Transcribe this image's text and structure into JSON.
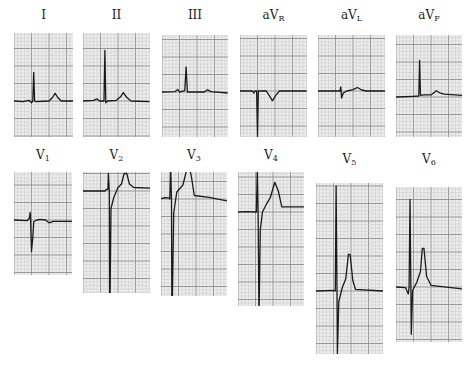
{
  "figure": {
    "paper_speed_mm_per_s": 25,
    "gain_mm_per_mV": 10,
    "grid_color_minor": "#c9c9c9",
    "grid_color_major": "#8f8f8f",
    "paper_color": "#ececec",
    "trace_color": "#1a1a1a"
  },
  "leads": [
    {
      "id": "I",
      "label": "I",
      "sub": "",
      "points": [
        [
          0,
          0
        ],
        [
          0.1,
          -0.02
        ],
        [
          0.17,
          0.02
        ],
        [
          0.2,
          -0.05
        ],
        [
          0.215,
          0
        ],
        [
          0.225,
          0.82
        ],
        [
          0.235,
          0
        ],
        [
          0.25,
          -0.02
        ],
        [
          0.4,
          0
        ],
        [
          0.44,
          0.1
        ],
        [
          0.47,
          0.22
        ],
        [
          0.5,
          0.1
        ],
        [
          0.54,
          0
        ],
        [
          0.68,
          0
        ]
      ]
    },
    {
      "id": "II",
      "label": "II",
      "sub": "",
      "points": [
        [
          0,
          0
        ],
        [
          0.12,
          0.02
        ],
        [
          0.16,
          0.06
        ],
        [
          0.19,
          0
        ],
        [
          0.24,
          0
        ],
        [
          0.25,
          1.45
        ],
        [
          0.26,
          -0.05
        ],
        [
          0.28,
          0
        ],
        [
          0.38,
          0.02
        ],
        [
          0.43,
          0.12
        ],
        [
          0.46,
          0.24
        ],
        [
          0.5,
          0.1
        ],
        [
          0.55,
          0
        ],
        [
          0.76,
          -0.02
        ]
      ]
    },
    {
      "id": "III",
      "label": "III",
      "sub": "",
      "points": [
        [
          0,
          0
        ],
        [
          0.15,
          0.01
        ],
        [
          0.18,
          0.07
        ],
        [
          0.2,
          0
        ],
        [
          0.26,
          0.04
        ],
        [
          0.275,
          0.72
        ],
        [
          0.29,
          0
        ],
        [
          0.48,
          0
        ],
        [
          0.52,
          0.06
        ],
        [
          0.56,
          0.01
        ],
        [
          0.75,
          -0.03
        ]
      ]
    },
    {
      "id": "aVR",
      "label": "aV",
      "sub": "R",
      "points": [
        [
          0,
          0
        ],
        [
          0.14,
          0
        ],
        [
          0.16,
          -0.06
        ],
        [
          0.17,
          0
        ],
        [
          0.19,
          0
        ],
        [
          0.2,
          -1.3
        ],
        [
          0.21,
          0
        ],
        [
          0.3,
          0
        ],
        [
          0.34,
          -0.15
        ],
        [
          0.37,
          -0.28
        ],
        [
          0.41,
          -0.12
        ],
        [
          0.45,
          0
        ],
        [
          0.76,
          0
        ]
      ]
    },
    {
      "id": "aVL",
      "label": "aV",
      "sub": "L",
      "points": [
        [
          0,
          0
        ],
        [
          0.25,
          0
        ],
        [
          0.26,
          0.12
        ],
        [
          0.27,
          -0.2
        ],
        [
          0.29,
          -0.05
        ],
        [
          0.33,
          0
        ],
        [
          0.4,
          0.04
        ],
        [
          0.45,
          0.1
        ],
        [
          0.5,
          0.03
        ],
        [
          0.55,
          0
        ],
        [
          0.77,
          0
        ]
      ]
    },
    {
      "id": "aVF",
      "label": "aV",
      "sub": "F",
      "points": [
        [
          0,
          0
        ],
        [
          0.2,
          0.02
        ],
        [
          0.26,
          0.03
        ],
        [
          0.27,
          1.05
        ],
        [
          0.28,
          0.05
        ],
        [
          0.32,
          0.06
        ],
        [
          0.4,
          0.06
        ],
        [
          0.46,
          0.18
        ],
        [
          0.5,
          0.12
        ],
        [
          0.55,
          0.08
        ],
        [
          0.76,
          0.05
        ]
      ]
    },
    {
      "id": "V1",
      "label": "V",
      "sub": "1",
      "points": [
        [
          0,
          0
        ],
        [
          0.15,
          -0.02
        ],
        [
          0.175,
          0.05
        ],
        [
          0.185,
          0.22
        ],
        [
          0.19,
          0
        ],
        [
          0.2,
          -0.9
        ],
        [
          0.215,
          -0.5
        ],
        [
          0.225,
          -0.05
        ],
        [
          0.26,
          0
        ],
        [
          0.3,
          0.02
        ],
        [
          0.36,
          0
        ],
        [
          0.4,
          -0.08
        ],
        [
          0.45,
          -0.04
        ],
        [
          0.67,
          -0.04
        ]
      ]
    },
    {
      "id": "V2",
      "label": "V",
      "sub": "2",
      "points": [
        [
          0,
          0
        ],
        [
          0.25,
          0
        ],
        [
          0.27,
          0.05
        ],
        [
          0.285,
          0.05
        ],
        [
          0.29,
          0.5
        ],
        [
          0.3,
          0
        ],
        [
          0.305,
          -4.0
        ],
        [
          0.32,
          -0.5
        ],
        [
          0.35,
          -0.2
        ],
        [
          0.4,
          0.1
        ],
        [
          0.44,
          0.2
        ],
        [
          0.47,
          0.5
        ],
        [
          0.5,
          0.5
        ],
        [
          0.53,
          0.2
        ],
        [
          0.58,
          0.1
        ],
        [
          0.77,
          0.08
        ]
      ]
    },
    {
      "id": "V3",
      "label": "V",
      "sub": "3",
      "points": [
        [
          0,
          0
        ],
        [
          0.04,
          0.04
        ],
        [
          0.09,
          0.03
        ],
        [
          0.1,
          0
        ],
        [
          0.11,
          0.95
        ],
        [
          0.12,
          0
        ],
        [
          0.125,
          -3.7
        ],
        [
          0.145,
          -0.4
        ],
        [
          0.18,
          0.2
        ],
        [
          0.25,
          0.4
        ],
        [
          0.29,
          0.8
        ],
        [
          0.32,
          1.0
        ],
        [
          0.35,
          0.6
        ],
        [
          0.38,
          0.1
        ],
        [
          0.55,
          0.05
        ],
        [
          0.76,
          -0.05
        ]
      ]
    },
    {
      "id": "V4",
      "label": "V",
      "sub": "4",
      "points": [
        [
          0,
          0
        ],
        [
          0.1,
          0.01
        ],
        [
          0.2,
          0.0
        ],
        [
          0.21,
          0
        ],
        [
          0.22,
          1.25
        ],
        [
          0.23,
          0
        ],
        [
          0.24,
          -3.05
        ],
        [
          0.255,
          -0.5
        ],
        [
          0.28,
          0.0
        ],
        [
          0.33,
          0.25
        ],
        [
          0.37,
          0.42
        ],
        [
          0.42,
          0.85
        ],
        [
          0.46,
          0.6
        ],
        [
          0.5,
          0.15
        ],
        [
          0.76,
          0.15
        ]
      ]
    },
    {
      "id": "V5",
      "label": "V",
      "sub": "5",
      "points": [
        [
          0,
          0
        ],
        [
          0.2,
          0.02
        ],
        [
          0.22,
          0
        ],
        [
          0.23,
          3.0
        ],
        [
          0.24,
          0
        ],
        [
          0.245,
          -1.8
        ],
        [
          0.26,
          -0.3
        ],
        [
          0.3,
          0.1
        ],
        [
          0.34,
          0.35
        ],
        [
          0.37,
          1.05
        ],
        [
          0.39,
          1.05
        ],
        [
          0.42,
          0.3
        ],
        [
          0.45,
          0.05
        ],
        [
          0.77,
          0
        ]
      ]
    },
    {
      "id": "V6",
      "label": "V",
      "sub": "6",
      "points": [
        [
          0,
          0
        ],
        [
          0.11,
          -0.02
        ],
        [
          0.14,
          -0.2
        ],
        [
          0.15,
          0
        ],
        [
          0.16,
          2.5
        ],
        [
          0.17,
          0
        ],
        [
          0.175,
          -1.35
        ],
        [
          0.19,
          -0.1
        ],
        [
          0.24,
          0.15
        ],
        [
          0.28,
          0.45
        ],
        [
          0.3,
          1.1
        ],
        [
          0.32,
          1.1
        ],
        [
          0.35,
          0.3
        ],
        [
          0.4,
          0.05
        ],
        [
          0.76,
          -0.05
        ]
      ]
    }
  ]
}
